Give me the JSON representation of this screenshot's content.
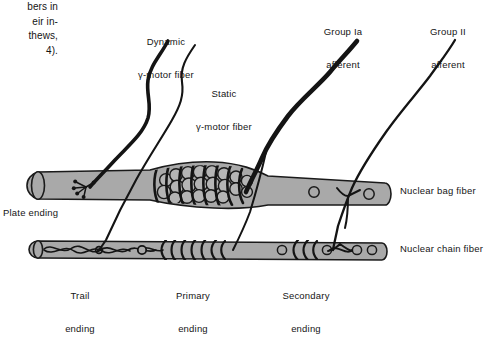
{
  "figure": {
    "kind": "anatomical-diagram",
    "caption_fragment": {
      "lines": [
        "bers in",
        "eir in-",
        "thews,",
        "4)."
      ]
    },
    "labels": {
      "dynamic_gamma": {
        "line1": "Dynamic",
        "line2": "γ-motor fiber"
      },
      "static_gamma": {
        "line1": "Static",
        "line2": "γ-motor fiber"
      },
      "group_ia": {
        "line1": "Group Ia",
        "line2": "afferent"
      },
      "group_ii": {
        "line1": "Group II",
        "line2": "afferent"
      },
      "nuclear_bag": "Nuclear bag fiber",
      "nuclear_chain": "Nuclear chain fiber",
      "plate_ending": "Plate ending",
      "trail_ending": {
        "line1": "Trail",
        "line2": "ending"
      },
      "primary_ending": {
        "line1": "Primary",
        "line2": "ending"
      },
      "secondary_ending": {
        "line1": "Secondary",
        "line2": "ending"
      }
    },
    "colors": {
      "fiber_fill": "#a9a9a9",
      "outline": "#1a1a1a",
      "nerve": "#141414",
      "background": "#ffffff",
      "text": "#141414"
    },
    "structures": [
      {
        "name": "nuclear-bag-fiber",
        "style": "thick intrafusal fiber with equatorial nuclear bag"
      },
      {
        "name": "nuclear-chain-fiber",
        "style": "thin intrafusal fiber with chain of nuclei"
      },
      {
        "name": "annulospiral-wrapping",
        "style": "primary ending spiral"
      },
      {
        "name": "flower-spray-ending",
        "style": "secondary ending"
      }
    ]
  }
}
